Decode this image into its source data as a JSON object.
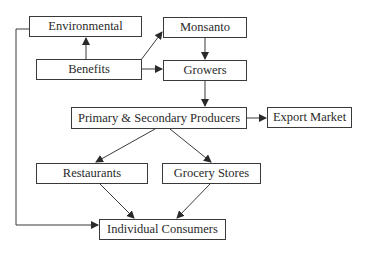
{
  "diagram": {
    "type": "flowchart",
    "nodes": [
      {
        "id": "environmental",
        "label": "Environmental",
        "x": 29,
        "y": 16,
        "w": 113,
        "h": 21
      },
      {
        "id": "monsanto",
        "label": "Monsanto",
        "x": 163,
        "y": 17,
        "w": 84,
        "h": 21
      },
      {
        "id": "benefits",
        "label": "Benefits",
        "x": 36,
        "y": 59,
        "w": 106,
        "h": 21
      },
      {
        "id": "growers",
        "label": "Growers",
        "x": 163,
        "y": 60,
        "w": 84,
        "h": 21
      },
      {
        "id": "producers",
        "label": "Primary & Secondary Producers",
        "x": 71,
        "y": 107,
        "w": 176,
        "h": 22
      },
      {
        "id": "export",
        "label": "Export Market",
        "x": 267,
        "y": 107,
        "w": 85,
        "h": 21
      },
      {
        "id": "restaurants",
        "label": "Restaurants",
        "x": 36,
        "y": 163,
        "w": 112,
        "h": 21
      },
      {
        "id": "grocery",
        "label": "Grocery Stores",
        "x": 162,
        "y": 163,
        "w": 99,
        "h": 21
      },
      {
        "id": "consumers",
        "label": "Individual Consumers",
        "x": 99,
        "y": 219,
        "w": 127,
        "h": 21
      }
    ],
    "edges": [
      {
        "from": "benefits",
        "to": "environmental"
      },
      {
        "from": "benefits",
        "to": "monsanto"
      },
      {
        "from": "benefits",
        "to": "growers"
      },
      {
        "from": "monsanto",
        "to": "growers"
      },
      {
        "from": "growers",
        "to": "producers"
      },
      {
        "from": "producers",
        "to": "export"
      },
      {
        "from": "producers",
        "to": "restaurants"
      },
      {
        "from": "producers",
        "to": "grocery"
      },
      {
        "from": "restaurants",
        "to": "consumers"
      },
      {
        "from": "grocery",
        "to": "consumers"
      },
      {
        "from": "environmental",
        "to": "consumers"
      }
    ],
    "colors": {
      "line": "#3a3a3a",
      "box_border": "#3a3a3a",
      "background": "#ffffff"
    }
  }
}
